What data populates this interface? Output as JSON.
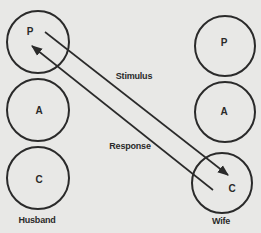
{
  "diagram": {
    "type": "transactional-analysis",
    "colors": {
      "background": "#e8e8e6",
      "stroke": "#2a2a2a"
    },
    "persons": [
      {
        "label": "Husband",
        "states": [
          "P",
          "A",
          "C"
        ]
      },
      {
        "label": "Wife",
        "states": [
          "P",
          "A",
          "C"
        ]
      }
    ],
    "transactions": [
      {
        "label": "Stimulus",
        "from": "Husband.P",
        "to": "Wife.C"
      },
      {
        "label": "Response",
        "from": "Wife.C",
        "to": "Husband.P"
      }
    ]
  }
}
